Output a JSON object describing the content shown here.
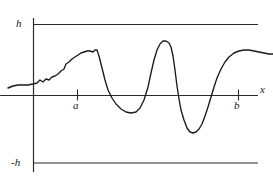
{
  "figure": {
    "background_color": "#ffffff",
    "ink_color": "#1a1a1a",
    "width": 273,
    "height": 181
  },
  "labels": {
    "upper_bound": "h",
    "lower_bound": "-h",
    "interval_start": "a",
    "interval_end": "b",
    "x_axis": "x"
  },
  "chart_data": {
    "type": "line",
    "title": "",
    "xlabel": "x",
    "ylabel": "",
    "grid": false,
    "legend": null,
    "axis_lines": {
      "y_axis_x_px": 33,
      "x_axis_y_px": 95,
      "upper_bound_line_y_px": 24,
      "lower_bound_line_y_px": 163,
      "horizontal_line_extent_px": [
        33,
        258
      ],
      "x_axis_extent_px": [
        0,
        258
      ],
      "y_axis_extent_px": [
        18,
        172
      ]
    },
    "ticks": [
      {
        "label": "a",
        "x_px": 77
      },
      {
        "label": "b",
        "x_px": 238
      }
    ],
    "y_reference_values": [
      "h",
      "0",
      "-h"
    ],
    "annotation": "An oscillating curve remaining strictly between the bounds y = h and y = -h",
    "curve_points_px": [
      [
        8,
        88
      ],
      [
        13,
        86
      ],
      [
        18,
        85
      ],
      [
        23,
        85
      ],
      [
        28,
        85
      ],
      [
        33,
        84
      ],
      [
        37,
        83
      ],
      [
        40,
        80
      ],
      [
        43,
        82
      ],
      [
        46,
        79
      ],
      [
        49,
        80
      ],
      [
        52,
        77
      ],
      [
        55,
        76
      ],
      [
        58,
        74
      ],
      [
        61,
        71
      ],
      [
        64,
        69
      ],
      [
        66,
        64
      ],
      [
        69,
        62
      ],
      [
        72,
        59
      ],
      [
        75,
        57
      ],
      [
        78,
        55
      ],
      [
        81,
        53
      ],
      [
        84,
        52
      ],
      [
        87,
        51
      ],
      [
        90,
        51
      ],
      [
        93,
        52
      ],
      [
        95,
        50
      ],
      [
        97,
        50
      ],
      [
        99,
        56
      ],
      [
        102,
        68
      ],
      [
        105,
        80
      ],
      [
        108,
        90
      ],
      [
        112,
        98
      ],
      [
        116,
        104
      ],
      [
        121,
        109
      ],
      [
        126,
        112
      ],
      [
        131,
        113
      ],
      [
        136,
        112
      ],
      [
        140,
        108
      ],
      [
        144,
        100
      ],
      [
        148,
        87
      ],
      [
        151,
        73
      ],
      [
        154,
        60
      ],
      [
        157,
        50
      ],
      [
        160,
        44
      ],
      [
        163,
        41
      ],
      [
        166,
        41
      ],
      [
        169,
        43
      ],
      [
        171,
        47
      ],
      [
        173,
        56
      ],
      [
        175,
        70
      ],
      [
        177,
        86
      ],
      [
        179,
        99
      ],
      [
        181,
        110
      ],
      [
        184,
        120
      ],
      [
        187,
        128
      ],
      [
        190,
        132
      ],
      [
        193,
        133
      ],
      [
        196,
        132
      ],
      [
        199,
        129
      ],
      [
        202,
        124
      ],
      [
        205,
        116
      ],
      [
        208,
        107
      ],
      [
        211,
        97
      ],
      [
        214,
        87
      ],
      [
        217,
        78
      ],
      [
        221,
        69
      ],
      [
        225,
        62
      ],
      [
        229,
        57
      ],
      [
        234,
        53
      ],
      [
        239,
        51
      ],
      [
        244,
        50
      ],
      [
        249,
        50
      ],
      [
        254,
        51
      ],
      [
        259,
        52
      ],
      [
        264,
        53
      ],
      [
        269,
        54
      ],
      [
        273,
        54
      ]
    ]
  }
}
